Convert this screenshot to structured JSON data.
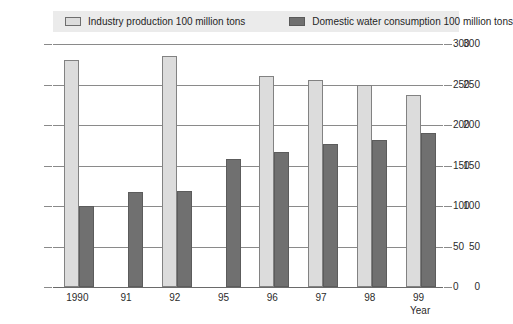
{
  "chart_data": {
    "type": "bar",
    "title": "",
    "xlabel": "Year",
    "ylabel": "",
    "ylim": [
      0,
      300
    ],
    "yticks": [
      0,
      50,
      100,
      150,
      200,
      250,
      300
    ],
    "grid": true,
    "legend_position": "top",
    "dual_axis": true,
    "categories": [
      "1990",
      "91",
      "92",
      "95",
      "96",
      "97",
      "98",
      "99"
    ],
    "series": [
      {
        "name": "Industry production 100 million tons",
        "color": "#dcdcdc",
        "values": [
          280,
          null,
          285,
          null,
          260,
          256,
          249,
          237
        ]
      },
      {
        "name": "Domestic water consumption 100 million tons",
        "color": "#707070",
        "values": [
          100,
          117,
          118,
          158,
          167,
          176,
          181,
          190
        ]
      }
    ]
  },
  "legend": {
    "items": [
      {
        "label": "Industry production 100 million tons",
        "swatch": "light"
      },
      {
        "label": "Domestic water consumption 100 million tons",
        "swatch": "dark"
      }
    ]
  },
  "axes": {
    "left_ticks": [
      "300",
      "250",
      "200",
      "150",
      "100",
      "50",
      "0"
    ],
    "right_ticks": [
      "300",
      "250",
      "200",
      "150",
      "100",
      "50",
      "0"
    ],
    "x_title": "Year"
  }
}
